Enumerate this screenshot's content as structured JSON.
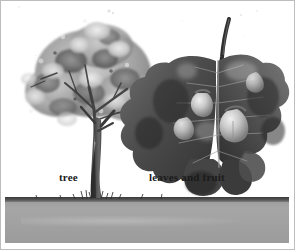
{
  "figure": {
    "medium": "grayscale botanical illustration",
    "background_color": "#ffffff",
    "border_color": "#bdbdbd"
  },
  "labels": {
    "tree": "tree",
    "leaves_and_fruit": "leaves and fruit"
  },
  "subjects": {
    "tree": {
      "name": "tree",
      "canopy_tone_light": "#e8e8e8",
      "canopy_tone_mid": "#9d9d9d",
      "canopy_tone_dark": "#4a4a4a",
      "trunk_color": "#3b3b3b"
    },
    "leaf_cluster": {
      "name": "leaves and fruit",
      "leaf_tone_dark": "#3e3e3e",
      "leaf_tone_mid": "#6b6b6b",
      "fruit_tone_light": "#d8d8d8",
      "stem_color": "#2e2e2e",
      "fruit_count": 4
    }
  },
  "ground": {
    "name": "ground",
    "band_color": "#a2a2a2",
    "grass_line_color": "#404040"
  }
}
